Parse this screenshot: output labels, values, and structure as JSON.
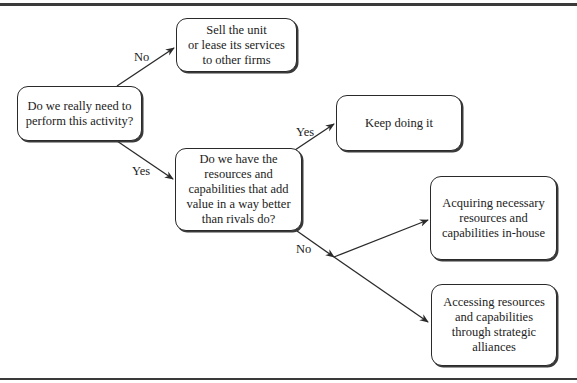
{
  "diagram": {
    "type": "decision-flowchart",
    "nodes": {
      "need_activity": {
        "text": "Do we really need to\nperform this activity?"
      },
      "sell_unit": {
        "text": "Sell the unit\nor lease its services\nto other firms"
      },
      "have_resources": {
        "text": "Do we have the\nresources and\ncapabilities that add\nvalue in a way better\nthan rivals do?"
      },
      "keep_doing": {
        "text": "Keep doing it"
      },
      "acquire_inhouse": {
        "text": "Acquiring necessary\nresources and\ncapabilities in-house"
      },
      "access_alliances": {
        "text": "Accessing resources\nand capabilities\nthrough strategic\nalliances"
      }
    },
    "edges": {
      "need_no": {
        "from": "need_activity",
        "to": "sell_unit",
        "label": "No"
      },
      "need_yes": {
        "from": "need_activity",
        "to": "have_resources",
        "label": "Yes"
      },
      "resources_yes": {
        "from": "have_resources",
        "to": "keep_doing",
        "label": "Yes"
      },
      "resources_no": {
        "from": "have_resources",
        "to": [
          "acquire_inhouse",
          "access_alliances"
        ],
        "label": "No"
      }
    },
    "colors": {
      "stroke": "#2a2a2a",
      "background": "#ffffff",
      "text": "#222222"
    }
  }
}
